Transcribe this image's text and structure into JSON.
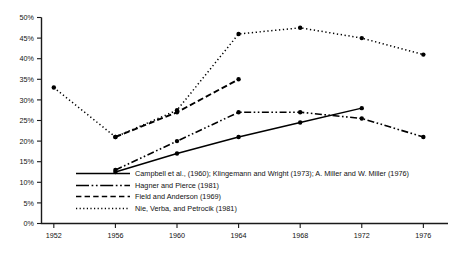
{
  "chart_data": {
    "type": "line",
    "title": "",
    "subtitle": "",
    "xlabel": "",
    "ylabel": "",
    "x": [
      1952,
      1956,
      1960,
      1964,
      1968,
      1972,
      1976
    ],
    "xlim": [
      1950,
      1978
    ],
    "ylim": [
      0,
      50
    ],
    "grid": false,
    "legend_position": "inside-lower-left",
    "y_ticks": [
      0,
      5,
      10,
      15,
      20,
      25,
      30,
      35,
      40,
      45,
      50
    ],
    "y_tick_labels": [
      "0%",
      "5%",
      "10%",
      "15%",
      "20%",
      "25%",
      "30%",
      "35%",
      "40%",
      "45%",
      "50%"
    ],
    "x_ticks": [
      1952,
      1956,
      1960,
      1964,
      1968,
      1972,
      1976
    ],
    "x_tick_labels": [
      "1952",
      "1956",
      "1960",
      "1964",
      "1968",
      "1972",
      "1976"
    ],
    "series": [
      {
        "name": "Campbell et al., (1960); Klingemann and Wright (1973); A. Miller and W. Miller (1976)",
        "style": "solid",
        "dasharray": "",
        "x": [
          1956,
          1960,
          1964,
          1968,
          1972
        ],
        "values": [
          12.5,
          17.0,
          21.0,
          24.5,
          28.0
        ]
      },
      {
        "name": "Hagner and Pierce (1981)",
        "style": "dash-dot",
        "dasharray": "7,2.5,1.6,2.5,1.6,2.5",
        "x": [
          1956,
          1960,
          1964,
          1968,
          1972,
          1976
        ],
        "values": [
          13.0,
          20.0,
          27.0,
          27.0,
          25.5,
          21.0
        ]
      },
      {
        "name": "Field and Anderson (1969)",
        "style": "dashed",
        "dasharray": "6,3",
        "x": [
          1956,
          1960,
          1964
        ],
        "values": [
          21.0,
          27.0,
          35.0
        ]
      },
      {
        "name": "Nie, Verba, and Petrocik (1981)",
        "style": "dotted",
        "dasharray": "1.3,2.6",
        "x": [
          1952,
          1956,
          1960,
          1964,
          1968,
          1972,
          1976
        ],
        "values": [
          33.0,
          21.0,
          27.5,
          46.0,
          47.5,
          45.0,
          41.0
        ]
      }
    ]
  },
  "legend": {
    "items": [
      {
        "label": "Campbell et al., (1960); Klingemann and Wright (1973); A. Miller and W. Miller (1976)"
      },
      {
        "label": "Hagner and Pierce (1981)"
      },
      {
        "label": "Field and Anderson (1969)"
      },
      {
        "label": "Nie, Verba, and Petrocik (1981)"
      }
    ]
  }
}
